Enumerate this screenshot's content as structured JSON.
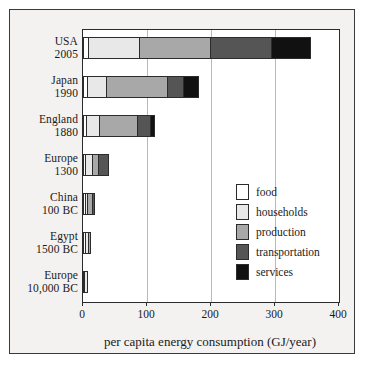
{
  "chart_data": {
    "type": "bar",
    "orientation": "horizontal",
    "stacked": true,
    "title": "",
    "subtitle": "",
    "xlabel": "per capita energy consumption (GJ/year)",
    "ylabel": "",
    "xlim": [
      0,
      400
    ],
    "xticks": [
      0,
      100,
      200,
      300,
      400
    ],
    "xticklabels": [
      "0",
      "100",
      "200",
      "300",
      "400"
    ],
    "grid": "vertical",
    "legend_position": "center-right-inside",
    "categories": [
      "USA 2005",
      "Japan 1990",
      "England 1880",
      "Europe 1300",
      "China 100 BC",
      "Egypt 1500 BC",
      "Europe 10,000 BC"
    ],
    "category_lines": [
      [
        "USA",
        "2005"
      ],
      [
        "Japan",
        "1990"
      ],
      [
        "England",
        "1880"
      ],
      [
        "Europe",
        "1300"
      ],
      [
        "China",
        "100 BC"
      ],
      [
        "Egypt",
        "1500 BC"
      ],
      [
        "Europe",
        "10,000 BC"
      ]
    ],
    "series": [
      {
        "name": "food",
        "color": "#ffffff",
        "values": [
          8,
          6,
          5,
          4,
          3,
          3,
          3
        ]
      },
      {
        "name": "households",
        "color": "#e8e8e8",
        "values": [
          80,
          31,
          21,
          11,
          5,
          7,
          5
        ]
      },
      {
        "name": "production",
        "color": "#a8a8a8",
        "values": [
          112,
          97,
          61,
          11,
          8,
          3,
          0
        ]
      },
      {
        "name": "transportation",
        "color": "#555555",
        "values": [
          97,
          25,
          20,
          15,
          2,
          0,
          0
        ]
      },
      {
        "name": "services",
        "color": "#111111",
        "values": [
          59,
          23,
          6,
          0,
          0,
          0,
          0
        ]
      }
    ],
    "totals": [
      356,
      182,
      113,
      41,
      18,
      13,
      8
    ],
    "legend_entries": [
      "food",
      "households",
      "production",
      "transportation",
      "services"
    ]
  },
  "colors": {
    "food": "#ffffff",
    "households": "#e8e8e8",
    "production": "#a8a8a8",
    "transportation": "#555555",
    "services": "#111111",
    "axis": "#2b2b2b",
    "grid": "#b9b9b9",
    "background": "#f3f2f0",
    "text": "#1a1a1a"
  }
}
